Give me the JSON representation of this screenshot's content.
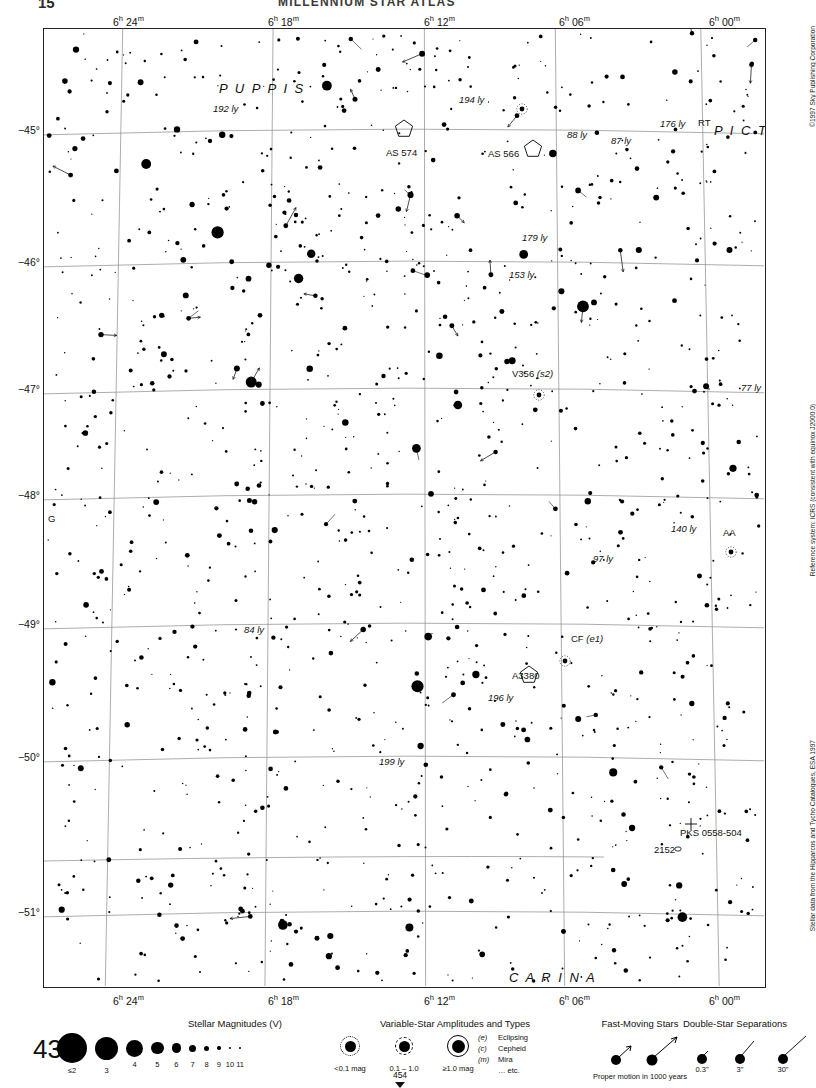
{
  "header": {
    "page_left": "15",
    "title": "MILLENNIUM STAR ATLAS"
  },
  "chart": {
    "page_number": "435",
    "next_page": "454",
    "ra_labels": [
      {
        "h": "6",
        "m": "24",
        "x": 113
      },
      {
        "h": "6",
        "m": "18",
        "x": 268
      },
      {
        "h": "6",
        "m": "12",
        "x": 424
      },
      {
        "h": "6",
        "m": "06",
        "x": 559
      },
      {
        "h": "6",
        "m": "00",
        "x": 709
      }
    ],
    "dec_labels": [
      "−45°",
      "−46°",
      "−47°",
      "−48°",
      "−49°",
      "−50°",
      "−51°"
    ],
    "constellations": [
      {
        "name": "P U P P I S",
        "x": 175,
        "y": 52
      },
      {
        "name": "P I C T O R",
        "x": 670,
        "y": 94
      },
      {
        "name": "C A R I N A",
        "x": 465,
        "y": 941
      }
    ],
    "annotations": [
      {
        "text": "192 ly",
        "x": 212,
        "y": 102,
        "style": "italic"
      },
      {
        "text": "194 ly",
        "x": 458,
        "y": 93,
        "style": "italic"
      },
      {
        "text": "176 ly",
        "x": 659,
        "y": 117,
        "style": "italic"
      },
      {
        "text": "RT",
        "x": 697,
        "y": 116,
        "style": "normal"
      },
      {
        "text": "88 ly",
        "x": 566,
        "y": 128,
        "style": "italic"
      },
      {
        "text": "87 ly",
        "x": 610,
        "y": 134,
        "style": "italic"
      },
      {
        "text": "AS 574",
        "x": 385,
        "y": 146,
        "style": "normal"
      },
      {
        "text": "AS 566",
        "x": 487,
        "y": 147,
        "style": "normal"
      },
      {
        "text": "179 ly",
        "x": 521,
        "y": 231,
        "style": "italic"
      },
      {
        "text": "153 ly",
        "x": 508,
        "y": 268,
        "style": "italic"
      },
      {
        "text": "V356 (s2)",
        "x": 511,
        "y": 367,
        "style": "mixed"
      },
      {
        "text": "77 ly",
        "x": 740,
        "y": 381,
        "style": "italic"
      },
      {
        "text": "G",
        "x": 47,
        "y": 512,
        "style": "normal"
      },
      {
        "text": "140 ly",
        "x": 670,
        "y": 522,
        "style": "italic"
      },
      {
        "text": "AA",
        "x": 722,
        "y": 526,
        "style": "normal"
      },
      {
        "text": "97 ly",
        "x": 592,
        "y": 552,
        "style": "italic"
      },
      {
        "text": "84 ly",
        "x": 243,
        "y": 623,
        "style": "italic"
      },
      {
        "text": "CF (e1)",
        "x": 570,
        "y": 632,
        "style": "mixed"
      },
      {
        "text": "A3380",
        "x": 511,
        "y": 669,
        "style": "normal"
      },
      {
        "text": "196 ly",
        "x": 487,
        "y": 691,
        "style": "italic"
      },
      {
        "text": "199 ly",
        "x": 378,
        "y": 755,
        "style": "italic"
      },
      {
        "text": "PKS 0558-504",
        "x": 679,
        "y": 826,
        "style": "normal"
      },
      {
        "text": "2152",
        "x": 653,
        "y": 843,
        "style": "normal"
      }
    ],
    "credits": [
      "©1997 Sky Publishing Corporation",
      "Reference system: ICRS (consistent with equinox J2000.0)",
      "Stellar data from the Hipparcos and Tycho Catalogues, ESA 1997"
    ]
  },
  "legend": {
    "magnitudes": {
      "title": "Stellar Magnitudes (V)",
      "labels": [
        "≤2",
        "3",
        "4",
        "5",
        "6",
        "7",
        "8",
        "9",
        "10",
        "11"
      ]
    },
    "variables": {
      "title": "Variable-Star Amplitudes and Types",
      "amplitude_labels": [
        "<0.1 mag",
        "0.1 – 1.0",
        "≥1.0 mag"
      ],
      "types": [
        {
          "code": "(e)",
          "name": "Eclipsing"
        },
        {
          "code": "(c)",
          "name": "Cepheid"
        },
        {
          "code": "(m)",
          "name": "Mira"
        },
        {
          "code": "",
          "name": "… etc."
        }
      ]
    },
    "fast_moving": {
      "title": "Fast-Moving Stars",
      "caption": "Proper motion in 1000 years"
    },
    "doubles": {
      "title": "Double-Star Separations",
      "labels": [
        "0.3\"",
        "3\"",
        "30\""
      ]
    }
  }
}
